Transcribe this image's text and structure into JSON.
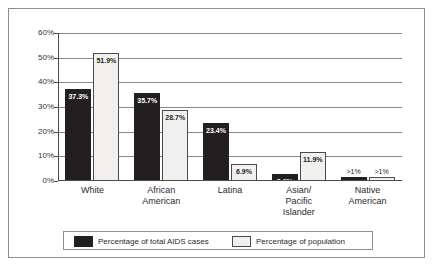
{
  "chart_data": {
    "type": "bar",
    "title": "",
    "xlabel": "",
    "ylabel": "",
    "ylim": [
      0,
      60
    ],
    "yticks": [
      "0%",
      "10%",
      "20%",
      "30%",
      "40%",
      "50%",
      "60%"
    ],
    "grid": true,
    "legend_position": "bottom",
    "categories": [
      "White",
      "African American",
      "Latina",
      "Asian/ Pacific Islander",
      "Native American"
    ],
    "category_lines": [
      [
        "White"
      ],
      [
        "African",
        "American"
      ],
      [
        "Latina"
      ],
      [
        "Asian/",
        "Pacific",
        "Islander"
      ],
      [
        "Native",
        "American"
      ]
    ],
    "series": [
      {
        "name": "Percentage of total AIDS cases",
        "color": "#231f20",
        "values": [
          37.3,
          35.7,
          23.4,
          2.9,
          0.5
        ],
        "labels": [
          "37.3%",
          "35.7%",
          "23.4%",
          "2.9%",
          ">1%"
        ]
      },
      {
        "name": "Percentage of population",
        "color": "#f1f0ee",
        "values": [
          51.9,
          28.7,
          6.9,
          11.9,
          0.5
        ],
        "labels": [
          "51.9%",
          "28.7%",
          "6.9%",
          "11.9%",
          ">1%"
        ]
      }
    ]
  },
  "legend": {
    "items": [
      {
        "label": "Percentage of total AIDS cases",
        "swatch": "dark"
      },
      {
        "label": "Percentage of population",
        "swatch": "light"
      }
    ]
  }
}
